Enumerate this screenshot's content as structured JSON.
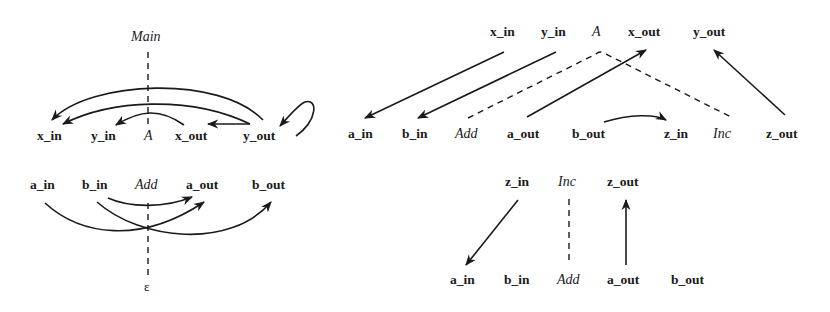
{
  "diagram_left_top": {
    "root_label": "Main",
    "nodes": [
      "x_in",
      "y_in",
      "A",
      "x_out",
      "y_out"
    ],
    "edges": [
      {
        "from": "y_out",
        "to": "x_in"
      },
      {
        "from": "y_out",
        "to": "x_out"
      },
      {
        "from": "y_out",
        "to": "y_out"
      },
      {
        "from": "x_out",
        "to": "y_in"
      },
      {
        "from": "y_out",
        "to": "x_in",
        "note": "inner arc"
      }
    ]
  },
  "diagram_left_bottom": {
    "nodes": [
      "a_in",
      "b_in",
      "Add",
      "a_out",
      "b_out"
    ],
    "leaf_label": "ε",
    "edges": [
      {
        "from": "b_in",
        "to": "a_out"
      },
      {
        "from": "a_in",
        "to": "a_out"
      },
      {
        "from": "b_in",
        "to": "b_out"
      }
    ]
  },
  "diagram_right_top": {
    "top_nodes": [
      "x_in",
      "y_in",
      "A",
      "x_out",
      "y_out"
    ],
    "bottom_nodes": [
      "a_in",
      "b_in",
      "Add",
      "a_out",
      "b_out",
      "z_in",
      "Inc",
      "z_out"
    ],
    "edges": [
      {
        "from": "x_in",
        "to": "a_in"
      },
      {
        "from": "y_in",
        "to": "b_in"
      },
      {
        "from": "a_out",
        "to": "x_out"
      },
      {
        "from": "b_out",
        "to": "z_in"
      },
      {
        "from": "z_out",
        "to": "y_out"
      }
    ],
    "dashed": [
      {
        "from": "A",
        "to": "Add"
      },
      {
        "from": "A",
        "to": "Inc"
      }
    ]
  },
  "diagram_right_bottom": {
    "top_nodes": [
      "z_in",
      "Inc",
      "z_out"
    ],
    "bottom_nodes": [
      "a_in",
      "b_in",
      "Add",
      "a_out",
      "b_out"
    ],
    "edges": [
      {
        "from": "z_in",
        "to": "a_in"
      },
      {
        "from": "a_out",
        "to": "z_out"
      }
    ],
    "dashed": [
      {
        "from": "Inc",
        "to": "Add"
      }
    ]
  }
}
